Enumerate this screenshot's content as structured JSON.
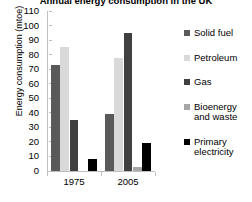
{
  "chart_data": {
    "type": "bar",
    "title": "Annual energy consumption in the UK",
    "xlabel": "",
    "ylabel": "Energy consumption (mtoe)",
    "categories": [
      "1975",
      "2005"
    ],
    "ylim": [
      0,
      110
    ],
    "yticks": [
      110,
      100,
      90,
      80,
      70,
      60,
      50,
      40,
      30,
      20,
      10,
      0
    ],
    "grid": false,
    "legend_position": "right",
    "series": [
      {
        "name": "Solid fuel",
        "color": "#595959",
        "values": [
          73,
          39
        ]
      },
      {
        "name": "Petroleum",
        "color": "#d9d9d9",
        "values": [
          85,
          78
        ]
      },
      {
        "name": "Gas",
        "color": "#404040",
        "values": [
          35,
          95
        ]
      },
      {
        "name": "Bioenergy and waste",
        "color": "#a6a6a6",
        "values": [
          0,
          3
        ]
      },
      {
        "name": "Primary electricity",
        "color": "#000000",
        "values": [
          8,
          19
        ]
      }
    ]
  },
  "legend": {
    "items": [
      {
        "label": "Solid fuel"
      },
      {
        "label": "Petroleum"
      },
      {
        "label": "Gas"
      },
      {
        "label": "Bioenergy and waste"
      },
      {
        "label": "Primary electricity"
      }
    ]
  }
}
